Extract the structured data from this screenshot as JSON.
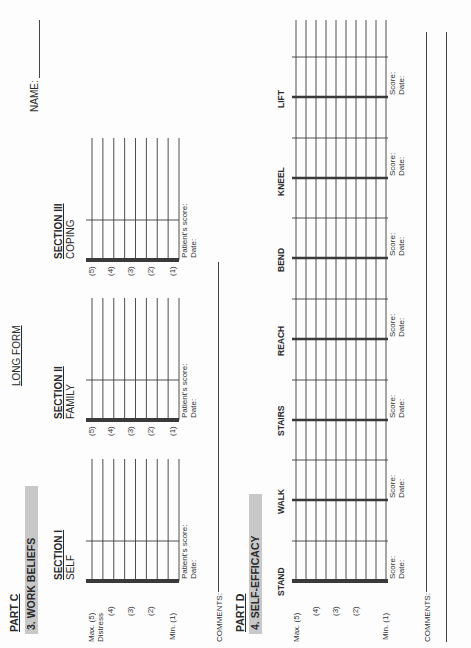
{
  "form": {
    "long_form_label": "LONG FORM",
    "name_label": "NAME:"
  },
  "part_c": {
    "part_label": "PART C",
    "title": "3.  WORK BELIEFS",
    "sections": [
      {
        "heading": "SECTION I",
        "subtitle": "SELF",
        "score_label": "Patient's score:",
        "date_label": "Date:"
      },
      {
        "heading": "SECTION II",
        "subtitle": "FAMILY",
        "score_label": "Patient's score:",
        "date_label": "Date:"
      },
      {
        "heading": "SECTION III",
        "subtitle": "COPING",
        "score_label": "Patient's score:",
        "date_label": "Date:"
      }
    ],
    "scale_first": [
      "Max. (5)",
      "Distress",
      "(4)",
      "(3)",
      "(2)",
      "Min.  (1)"
    ],
    "scale": [
      "(5)",
      "(4)",
      "(3)",
      "(2)",
      "(1)"
    ],
    "comments_label": "COMMENTS:"
  },
  "part_d": {
    "part_label": "PART D",
    "title": "4.   SELF-EFFICACY",
    "scale": [
      "Max. (5)",
      "(4)",
      "(3)",
      "(2)",
      "Min. (1)"
    ],
    "activities": [
      {
        "label": "STAND",
        "score_label": "Score:",
        "date_label": "Date:"
      },
      {
        "label": "WALK",
        "score_label": "Score:",
        "date_label": "Date:"
      },
      {
        "label": "STAIRS",
        "score_label": "Score:",
        "date_label": "Date:"
      },
      {
        "label": "REACH",
        "score_label": "Score:",
        "date_label": "Date:"
      },
      {
        "label": "BEND",
        "score_label": "Score:",
        "date_label": "Date:"
      },
      {
        "label": "KNEEL",
        "score_label": "Score:",
        "date_label": "Date:"
      },
      {
        "label": "LIFT",
        "score_label": "Score:",
        "date_label": "Date:"
      }
    ],
    "comments_label": "COMMENTS:"
  }
}
